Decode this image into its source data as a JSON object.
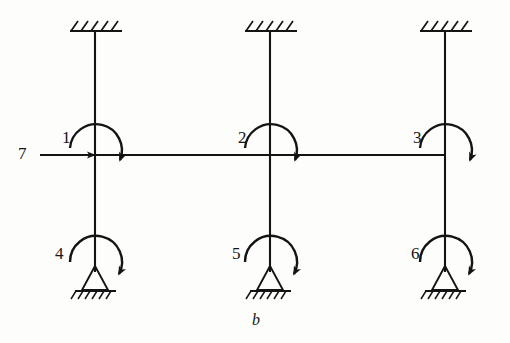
{
  "figure": {
    "caption": "b",
    "background_color": "#fdfdfb",
    "ink_color": "#141414",
    "type": "structural-frame-diagram"
  },
  "columns": [
    {
      "id": "column-left",
      "x": 95,
      "top_y": 31,
      "bottom_y": 272
    },
    {
      "id": "column-middle",
      "x": 270,
      "top_y": 31,
      "bottom_y": 272
    },
    {
      "id": "column-right",
      "x": 445,
      "top_y": 31,
      "bottom_y": 272
    }
  ],
  "beam": {
    "y": 155,
    "x_start": 95,
    "x_end": 445
  },
  "fixed_supports": [
    {
      "name": "fixed-support-top-left",
      "x": 95,
      "y": 31
    },
    {
      "name": "fixed-support-top-middle",
      "x": 270,
      "y": 31
    },
    {
      "name": "fixed-support-top-right",
      "x": 445,
      "y": 31
    }
  ],
  "pin_supports": [
    {
      "name": "pin-support-bottom-left",
      "x": 95,
      "y": 292
    },
    {
      "name": "pin-support-bottom-middle",
      "x": 270,
      "y": 292
    },
    {
      "name": "pin-support-bottom-right",
      "x": 445,
      "y": 292
    }
  ],
  "moments": [
    {
      "id": 1,
      "label": "1",
      "name": "moment-1",
      "cx": 95,
      "cy": 155,
      "radius": 26,
      "label_x": 62,
      "label_y": 129
    },
    {
      "id": 2,
      "label": "2",
      "name": "moment-2",
      "cx": 270,
      "cy": 155,
      "radius": 26,
      "label_x": 238,
      "label_y": 129
    },
    {
      "id": 3,
      "label": "3",
      "name": "moment-3",
      "cx": 445,
      "cy": 155,
      "radius": 26,
      "label_x": 413,
      "label_y": 129
    },
    {
      "id": 4,
      "label": "4",
      "name": "moment-4",
      "cx": 95,
      "cy": 268,
      "radius": 26,
      "label_x": 55,
      "label_y": 245
    },
    {
      "id": 5,
      "label": "5",
      "name": "moment-5",
      "cx": 270,
      "cy": 268,
      "radius": 26,
      "label_x": 232,
      "label_y": 245
    },
    {
      "id": 6,
      "label": "6",
      "name": "moment-6",
      "cx": 445,
      "cy": 268,
      "radius": 26,
      "label_x": 411,
      "label_y": 245
    }
  ],
  "force": {
    "id": 7,
    "label": "7",
    "name": "horizontal-force-7",
    "direction": "right",
    "y": 155,
    "x_start": 40,
    "x_end": 95,
    "label_x": 18,
    "label_y": 145
  },
  "caption_position": {
    "x": 252,
    "y": 312
  }
}
